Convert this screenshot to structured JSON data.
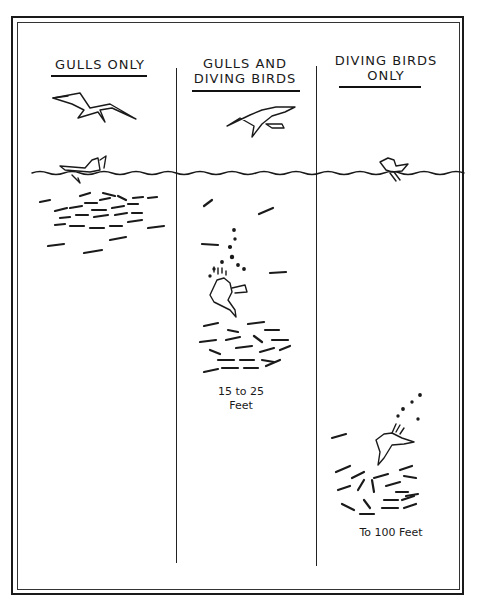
{
  "columns": [
    {
      "heading_lines": [
        "GULLS ONLY"
      ],
      "depth_label_lines": []
    },
    {
      "heading_lines": [
        "GULLS AND",
        "DIVING BIRDS"
      ],
      "depth_label_lines": [
        "15 to 25",
        "Feet"
      ]
    },
    {
      "heading_lines": [
        "DIVING BIRDS",
        "ONLY"
      ],
      "depth_label_lines": [
        "To 100 Feet"
      ]
    }
  ],
  "colors": {
    "ink": "#1a1a1a",
    "paper": "#ffffff"
  }
}
